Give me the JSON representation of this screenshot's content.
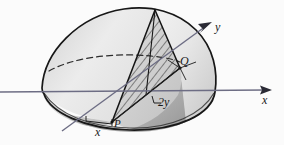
{
  "figure": {
    "type": "math-solid-diagram",
    "background_color": "#fbfbfb",
    "surface_color": "#e9e9e9",
    "surface_shadow_color": "#b5b5b5",
    "outline_color": "#1a1a1a",
    "axis_color": "#6b6b82",
    "hatch_color": "#3a3a3a"
  },
  "labels": {
    "y_axis": "y",
    "x_axis": "x",
    "point_q": "Q",
    "point_p": "P",
    "dim_x": "x",
    "dim_2y": "2y"
  },
  "geometry": {
    "x_axis_start": [
      0,
      92
    ],
    "x_axis_end": [
      272,
      90
    ],
    "y_axis_start": [
      62,
      131
    ],
    "y_axis_end": [
      212,
      22
    ],
    "apex": [
      155,
      10
    ],
    "point_p": [
      112,
      122
    ],
    "point_q": [
      180,
      68
    ],
    "dim_bracket_left": [
      86,
      119
    ],
    "dim_bracket_right": [
      113,
      123
    ]
  }
}
